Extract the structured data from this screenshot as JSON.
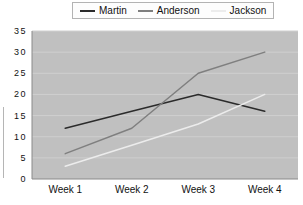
{
  "chart_data": {
    "type": "line",
    "categories": [
      "Week 1",
      "Week 2",
      "Week 3",
      "Week 4"
    ],
    "series": [
      {
        "name": "Martin",
        "values": [
          12,
          16,
          20,
          16
        ],
        "color": "#2b2b2b"
      },
      {
        "name": "Anderson",
        "values": [
          6,
          12,
          25,
          30
        ],
        "color": "#7f7f7f"
      },
      {
        "name": "Jackson",
        "values": [
          3,
          8,
          13,
          20
        ],
        "color": "#ececec"
      }
    ],
    "title": "",
    "xlabel": "",
    "ylabel": "",
    "ylim": [
      0,
      35
    ],
    "ytick_step": 5,
    "yticks_top_to_bottom": [
      "35",
      "30",
      "25",
      "20",
      "15",
      "10",
      "5",
      "0"
    ],
    "grid": true,
    "legend_position": "top-center",
    "colors": {
      "plot_background": "#c0c0c0",
      "gridline": "#cfcfcf",
      "axis_line": "#8a8a8a",
      "page_background": "#ffffff",
      "text": "#111111",
      "legend_border": "#b3b3b3",
      "legend_background": "#fdfdfd"
    }
  }
}
